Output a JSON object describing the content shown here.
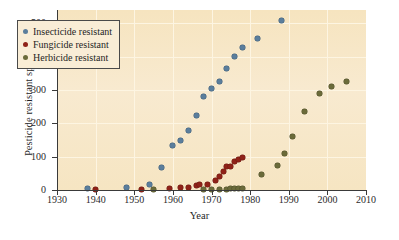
{
  "chart_data": {
    "type": "scatter",
    "title": "",
    "xlabel": "Year",
    "ylabel": "Pesticide resistant species",
    "xlim": [
      1930,
      2010
    ],
    "ylim": [
      0,
      540
    ],
    "xticks": [
      1930,
      1940,
      1950,
      1960,
      1970,
      1980,
      1990,
      2000,
      2010
    ],
    "yticks": [
      0,
      100,
      200,
      300,
      400,
      500
    ],
    "grid": true,
    "legend_position": "upper-left-inside",
    "background_color": "#f7e6c3",
    "series": [
      {
        "name": "Insecticide resistant",
        "color": "#5b7e9c",
        "points": [
          [
            1938,
            5
          ],
          [
            1948,
            9
          ],
          [
            1954,
            18
          ],
          [
            1957,
            68
          ],
          [
            1960,
            135
          ],
          [
            1962,
            150
          ],
          [
            1964,
            180
          ],
          [
            1966,
            225
          ],
          [
            1968,
            280
          ],
          [
            1970,
            305
          ],
          [
            1972,
            325
          ],
          [
            1974,
            365
          ],
          [
            1976,
            400
          ],
          [
            1978,
            428
          ],
          [
            1982,
            455
          ],
          [
            1988,
            510
          ]
        ]
      },
      {
        "name": "Fungicide resistant",
        "color": "#8f2218",
        "points": [
          [
            1940,
            1
          ],
          [
            1952,
            2
          ],
          [
            1959,
            6
          ],
          [
            1962,
            8
          ],
          [
            1964,
            9
          ],
          [
            1966,
            14
          ],
          [
            1967,
            16
          ],
          [
            1969,
            17
          ],
          [
            1971,
            30
          ],
          [
            1972,
            42
          ],
          [
            1973,
            55
          ],
          [
            1974,
            70
          ],
          [
            1975,
            72
          ],
          [
            1976,
            85
          ],
          [
            1977,
            92
          ],
          [
            1978,
            98
          ]
        ]
      },
      {
        "name": "Herbicide resistant",
        "color": "#6b6b3a",
        "points": [
          [
            1955,
            1
          ],
          [
            1968,
            2
          ],
          [
            1970,
            2
          ],
          [
            1972,
            3
          ],
          [
            1974,
            3
          ],
          [
            1975,
            4
          ],
          [
            1976,
            4
          ],
          [
            1977,
            5
          ],
          [
            1978,
            5
          ],
          [
            1983,
            48
          ],
          [
            1987,
            75
          ],
          [
            1989,
            110
          ],
          [
            1991,
            160
          ],
          [
            1994,
            235
          ],
          [
            1998,
            290
          ],
          [
            2001,
            310
          ],
          [
            2005,
            325
          ]
        ]
      }
    ]
  },
  "legend": {
    "items": [
      {
        "label": "Insecticide resistant",
        "color": "#5b7e9c",
        "key": "ins"
      },
      {
        "label": "Fungicide resistant",
        "color": "#8f2218",
        "key": "fun"
      },
      {
        "label": "Herbicide resistant",
        "color": "#6b6b3a",
        "key": "her"
      }
    ]
  }
}
